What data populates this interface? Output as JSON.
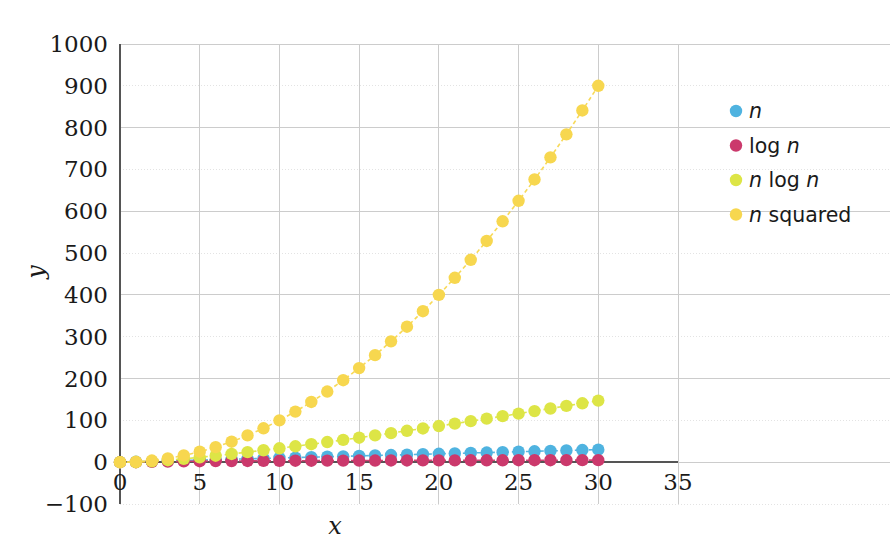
{
  "chart_data": {
    "type": "line",
    "title": "",
    "subtitle": "",
    "xlabel": "x",
    "ylabel": "y",
    "xlim": [
      0,
      35
    ],
    "ylim": [
      -100,
      1000
    ],
    "xticks": [
      0,
      5,
      10,
      15,
      20,
      25,
      30,
      35
    ],
    "xtick_labels": [
      "0",
      "5",
      "10",
      "15",
      "20",
      "25",
      "30",
      "35"
    ],
    "yticks": [
      -100,
      0,
      100,
      200,
      300,
      400,
      500,
      600,
      700,
      800,
      900,
      1000
    ],
    "ytick_labels": [
      "−100",
      "0",
      "100",
      "200",
      "300",
      "400",
      "500",
      "600",
      "700",
      "800",
      "900",
      "1000"
    ],
    "grid": true,
    "legend_position": "right",
    "marker": "circle",
    "linestyle": "dashed",
    "x": [
      0,
      1,
      2,
      3,
      4,
      5,
      6,
      7,
      8,
      9,
      10,
      11,
      12,
      13,
      14,
      15,
      16,
      17,
      18,
      19,
      20,
      21,
      22,
      23,
      24,
      25,
      26,
      27,
      28,
      29,
      30
    ],
    "series": [
      {
        "name": "n",
        "label_plain": "n",
        "color": "#4FB3E0",
        "values": [
          0,
          1,
          2,
          3,
          4,
          5,
          6,
          7,
          8,
          9,
          10,
          11,
          12,
          13,
          14,
          15,
          16,
          17,
          18,
          19,
          20,
          21,
          22,
          23,
          24,
          25,
          26,
          27,
          28,
          29,
          30
        ]
      },
      {
        "name": "log n",
        "label_plain": "log n",
        "color": "#CB396C",
        "values": [
          0,
          0,
          1,
          1.585,
          2,
          2.322,
          2.585,
          2.807,
          3,
          3.17,
          3.322,
          3.459,
          3.585,
          3.7,
          3.807,
          3.907,
          4,
          4.087,
          4.17,
          4.248,
          4.322,
          4.392,
          4.459,
          4.524,
          4.585,
          4.644,
          4.7,
          4.755,
          4.807,
          4.858,
          4.907
        ]
      },
      {
        "name": "n log n",
        "label_plain": "n log n",
        "color": "#DDE546",
        "values": [
          0,
          0,
          2,
          4.755,
          8,
          11.61,
          15.51,
          19.65,
          24,
          28.53,
          33.22,
          38.05,
          43.02,
          48.11,
          53.3,
          58.6,
          64,
          69.48,
          75.06,
          80.71,
          86.44,
          92.23,
          98.1,
          104.04,
          110.04,
          116.1,
          122.21,
          128.38,
          134.6,
          140.87,
          147.21
        ]
      },
      {
        "name": "n squared",
        "label_plain": "n squared",
        "color": "#F7D74F",
        "values": [
          0,
          1,
          4,
          9,
          16,
          25,
          36,
          49,
          64,
          81,
          100,
          121,
          144,
          169,
          196,
          225,
          256,
          289,
          324,
          361,
          400,
          441,
          484,
          529,
          576,
          625,
          676,
          729,
          784,
          841,
          900
        ]
      }
    ],
    "legend": [
      {
        "label": "n",
        "color": "#4FB3E0",
        "parts": [
          {
            "t": "n",
            "italic": true
          }
        ]
      },
      {
        "label": "log n",
        "color": "#CB396C",
        "parts": [
          {
            "t": "log ",
            "italic": false
          },
          {
            "t": "n",
            "italic": true
          }
        ]
      },
      {
        "label": "n log n",
        "color": "#DDE546",
        "parts": [
          {
            "t": "n",
            "italic": true
          },
          {
            "t": " log ",
            "italic": false
          },
          {
            "t": "n",
            "italic": true
          }
        ]
      },
      {
        "label": "n squared",
        "color": "#F7D74F",
        "parts": [
          {
            "t": "n",
            "italic": true
          },
          {
            "t": " squared",
            "italic": false
          }
        ]
      }
    ],
    "colors": {
      "n": "#4FB3E0",
      "log_n": "#CB396C",
      "n_log_n": "#DDE546",
      "n_squared": "#F7D74F",
      "grid": "#cccccc",
      "grid_minor": "#e3e3e3",
      "axis": "#555555",
      "text": "#1a1a1a",
      "background": "#ffffff"
    }
  }
}
